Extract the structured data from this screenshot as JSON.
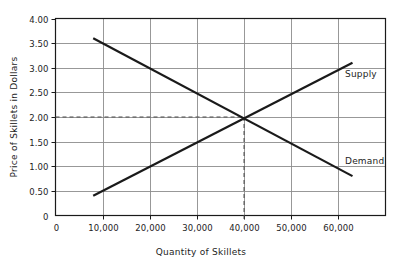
{
  "chart_data": {
    "type": "line",
    "title": "",
    "xlabel": "Quantity of Skillets",
    "ylabel": "Price of Skillets in Dollars",
    "xlim": [
      0,
      70000
    ],
    "ylim": [
      0,
      4.0
    ],
    "grid": true,
    "legend_position": "inline-right",
    "x_tick_labels": [
      "0",
      "10,000",
      "20,000",
      "30,000",
      "40,000",
      "50,000",
      "60,000"
    ],
    "x_tick_values": [
      0,
      10000,
      20000,
      30000,
      40000,
      50000,
      60000
    ],
    "y_tick_labels": [
      "0",
      "0.50",
      "1.00",
      "1.50",
      "2.00",
      "2.50",
      "3.00",
      "3.50",
      "4.00"
    ],
    "y_tick_values": [
      0,
      0.5,
      1.0,
      1.5,
      2.0,
      2.5,
      3.0,
      3.5,
      4.0
    ],
    "series": [
      {
        "name": "Supply",
        "label": "Supply",
        "x": [
          8000,
          63000
        ],
        "values": [
          0.4,
          3.1
        ],
        "color": "#1a1a1a"
      },
      {
        "name": "Demand",
        "label": "Demand",
        "x": [
          8000,
          63000
        ],
        "values": [
          3.6,
          0.8
        ],
        "color": "#1a1a1a"
      }
    ],
    "annotations": [
      {
        "name": "equilibrium",
        "x": 40000,
        "y": 2.0,
        "guide_style": "dashed",
        "color": "#4d4d4d"
      }
    ],
    "colors": {
      "axis": "#1a1a1a",
      "grid": "#8c8c8c",
      "series": "#1a1a1a",
      "guide": "#4d4d4d",
      "background": "#ffffff"
    }
  }
}
